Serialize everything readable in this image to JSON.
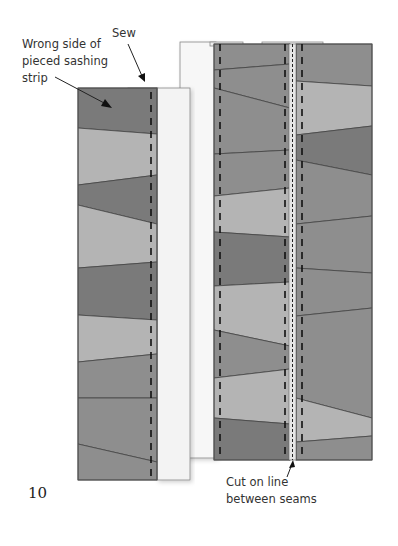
{
  "figure": {
    "number": "10",
    "labels": {
      "wrong_side": "Wrong side of\npieced sashing\nstrip",
      "sew": "Sew",
      "cut": "Cut on line\nbetween seams"
    }
  },
  "colors": {
    "dark": "#7a7a7a",
    "medium": "#8e8e8e",
    "light": "#b4b4b4",
    "strip_light": "#efefef",
    "panel_white": "#f7f7f7",
    "outline": "#555555",
    "seam": "#111111"
  },
  "left_strip": {
    "x": 78,
    "y": 88,
    "w": 79,
    "h": 392,
    "pieces": [
      {
        "y0l": 88,
        "y0r": 88,
        "y1l": 128,
        "y1r": 134,
        "shade": "dark"
      },
      {
        "y0l": 128,
        "y0r": 134,
        "y1l": 185,
        "y1r": 175,
        "shade": "light"
      },
      {
        "y0l": 185,
        "y0r": 175,
        "y1l": 205,
        "y1r": 224,
        "shade": "dark"
      },
      {
        "y0l": 205,
        "y0r": 224,
        "y1l": 268,
        "y1r": 262,
        "shade": "light"
      },
      {
        "y0l": 268,
        "y0r": 262,
        "y1l": 315,
        "y1r": 320,
        "shade": "dark"
      },
      {
        "y0l": 315,
        "y0r": 320,
        "y1l": 362,
        "y1r": 354,
        "shade": "light"
      },
      {
        "y0l": 362,
        "y0r": 354,
        "y1l": 398,
        "y1r": 398,
        "shade": "medium"
      },
      {
        "y0l": 398,
        "y0r": 398,
        "y1l": 444,
        "y1r": 462,
        "shade": "medium"
      },
      {
        "y0l": 444,
        "y0r": 462,
        "y1l": 488,
        "y1r": 482,
        "shade": "medium"
      }
    ]
  },
  "mid_strip": {
    "x": 214,
    "y": 44,
    "w": 76,
    "h": 416,
    "pieces": [
      {
        "y0l": 44,
        "y0r": 44,
        "y1l": 70,
        "y1r": 64,
        "shade": "medium"
      },
      {
        "y0l": 70,
        "y0r": 64,
        "y1l": 88,
        "y1r": 108,
        "shade": "medium"
      },
      {
        "y0l": 88,
        "y0r": 108,
        "y1l": 154,
        "y1r": 150,
        "shade": "medium"
      },
      {
        "y0l": 154,
        "y0r": 150,
        "y1l": 196,
        "y1r": 188,
        "shade": "medium"
      },
      {
        "y0l": 196,
        "y0r": 188,
        "y1l": 232,
        "y1r": 237,
        "shade": "light"
      },
      {
        "y0l": 232,
        "y0r": 237,
        "y1l": 286,
        "y1r": 282,
        "shade": "dark"
      },
      {
        "y0l": 286,
        "y0r": 282,
        "y1l": 330,
        "y1r": 346,
        "shade": "light"
      },
      {
        "y0l": 330,
        "y0r": 346,
        "y1l": 378,
        "y1r": 369,
        "shade": "medium"
      },
      {
        "y0l": 378,
        "y0r": 369,
        "y1l": 418,
        "y1r": 424,
        "shade": "light"
      },
      {
        "y0l": 418,
        "y0r": 424,
        "y1l": 460,
        "y1r": 460,
        "shade": "dark"
      }
    ]
  },
  "right_strip": {
    "x": 296,
    "y": 44,
    "w": 76,
    "h": 416,
    "pieces": [
      {
        "y0l": 44,
        "y0r": 44,
        "y1l": 81,
        "y1r": 86,
        "shade": "medium"
      },
      {
        "y0l": 81,
        "y0r": 86,
        "y1l": 135,
        "y1r": 126,
        "shade": "light"
      },
      {
        "y0l": 135,
        "y0r": 126,
        "y1l": 160,
        "y1r": 175,
        "shade": "dark"
      },
      {
        "y0l": 160,
        "y0r": 175,
        "y1l": 224,
        "y1r": 216,
        "shade": "medium"
      },
      {
        "y0l": 224,
        "y0r": 216,
        "y1l": 268,
        "y1r": 273,
        "shade": "medium"
      },
      {
        "y0l": 268,
        "y0r": 273,
        "y1l": 316,
        "y1r": 308,
        "shade": "medium"
      },
      {
        "y0l": 316,
        "y0r": 308,
        "y1l": 398,
        "y1r": 418,
        "shade": "medium"
      },
      {
        "y0l": 398,
        "y0r": 418,
        "y1l": 442,
        "y1r": 436,
        "shade": "light"
      },
      {
        "y0l": 442,
        "y0r": 436,
        "y1l": 460,
        "y1r": 460,
        "shade": "medium"
      }
    ]
  }
}
